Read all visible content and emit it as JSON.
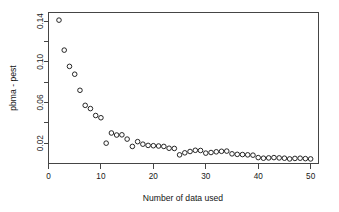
{
  "chart_data": {
    "type": "scatter",
    "title": "",
    "xlabel": "Number of data used",
    "ylabel": "pbma - pest",
    "xlim": [
      0.0,
      51.5
    ],
    "ylim": [
      0.0,
      0.1485
    ],
    "grid": false,
    "legend": null,
    "marker": "open-circle",
    "xticks": [
      0,
      10,
      20,
      30,
      40,
      50
    ],
    "xtick_labels": [
      "0",
      "10",
      "20",
      "30",
      "40",
      "50"
    ],
    "yticks": [
      0.02,
      0.06,
      0.1,
      0.14
    ],
    "ytick_labels": [
      "0.02",
      "0.06",
      "0.10",
      "0.14"
    ],
    "minor_yticks": [
      0.04,
      0.08,
      0.12
    ],
    "x": [
      2,
      3,
      4,
      5,
      6,
      7,
      8,
      9,
      10,
      11,
      12,
      13,
      14,
      15,
      16,
      17,
      18,
      19,
      20,
      21,
      22,
      23,
      24,
      25,
      26,
      27,
      28,
      29,
      30,
      31,
      32,
      33,
      34,
      35,
      36,
      37,
      38,
      39,
      40,
      41,
      42,
      43,
      44,
      45,
      46,
      47,
      48,
      49,
      50
    ],
    "y": [
      0.141,
      0.1115,
      0.0955,
      0.0878,
      0.072,
      0.0572,
      0.054,
      0.0472,
      0.045,
      0.02,
      0.03,
      0.028,
      0.0282,
      0.024,
      0.0168,
      0.0215,
      0.019,
      0.0178,
      0.0175,
      0.0172,
      0.0168,
      0.015,
      0.0148,
      0.0085,
      0.0105,
      0.0118,
      0.013,
      0.0128,
      0.0102,
      0.0108,
      0.0115,
      0.012,
      0.0122,
      0.0095,
      0.009,
      0.0088,
      0.0085,
      0.0082,
      0.0058,
      0.0052,
      0.0055,
      0.0058,
      0.0055,
      0.0052,
      0.0045,
      0.005,
      0.0052,
      0.0048,
      0.0045
    ]
  },
  "style": {
    "background": "#ffffff",
    "axis_color": "#454545",
    "point_color": "#1b1b1b",
    "text_color": "#171717"
  }
}
